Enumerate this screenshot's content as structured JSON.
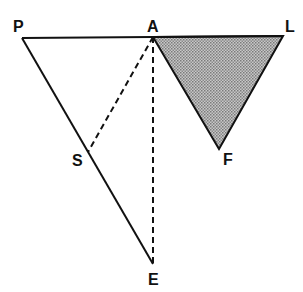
{
  "diagram": {
    "points": {
      "P": {
        "label": "P",
        "x": 22,
        "y": 38
      },
      "A": {
        "label": "A",
        "x": 153,
        "y": 37
      },
      "L": {
        "label": "L",
        "x": 283,
        "y": 36
      },
      "F": {
        "label": "F",
        "x": 219,
        "y": 149
      },
      "S": {
        "label": "S",
        "x": 88,
        "y": 152
      },
      "E": {
        "label": "E",
        "x": 153,
        "y": 264
      }
    },
    "solid_segments": [
      "PL",
      "PE",
      "AF",
      "LF"
    ],
    "dashed_segments": [
      "AS",
      "AE"
    ],
    "shaded_triangle": [
      "A",
      "L",
      "F"
    ],
    "shade_color": "#a8a8a8",
    "line_color": "#111111"
  }
}
